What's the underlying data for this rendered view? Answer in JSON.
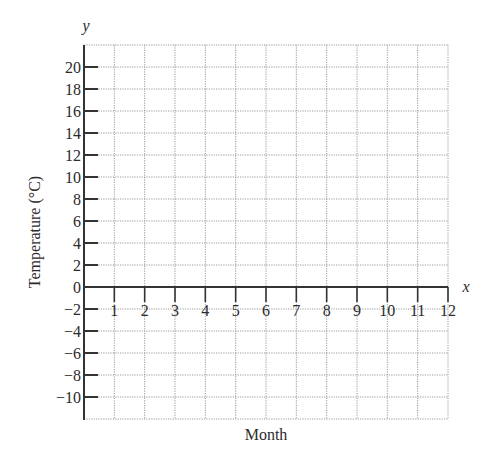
{
  "chart_data": {
    "type": "line",
    "title": "",
    "xlabel": "Month",
    "ylabel": "Temperature (°C)",
    "x_axis_variable": "x",
    "y_axis_variable": "y",
    "x_ticks": [
      1,
      2,
      3,
      4,
      5,
      6,
      7,
      8,
      9,
      10,
      11,
      12
    ],
    "y_ticks": [
      20,
      18,
      16,
      14,
      12,
      10,
      8,
      6,
      4,
      2,
      0,
      -2,
      -4,
      -6,
      -8,
      -10
    ],
    "xlim": [
      0,
      12
    ],
    "ylim": [
      -12,
      22
    ],
    "grid": true,
    "grid_style": "dotted",
    "series": [],
    "legend": null
  },
  "colors": {
    "axis": "#333333",
    "grid": "#9a9a9a",
    "text": "#2b2b2b",
    "background": "#ffffff"
  }
}
